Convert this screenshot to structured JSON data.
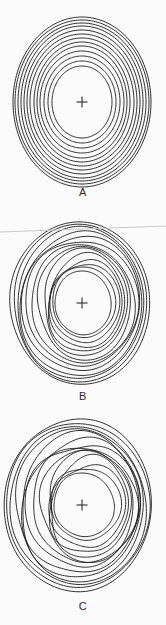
{
  "figure": {
    "width": 166,
    "height": 625,
    "background_color": "#fbfbfb",
    "line_color": "#1a1a1a",
    "marker_color": "#2b2b2b",
    "artifact_color": "#c9c9c9"
  },
  "panels": [
    {
      "id": "A",
      "label": "A",
      "label_y": 186,
      "center": {
        "x": 82,
        "y": 102
      },
      "marker": "plus-cross",
      "marker_size": 11,
      "ring_count": 13,
      "regularity": "regular",
      "bbox": {
        "x": 13,
        "y": 12,
        "width": 139,
        "height": 170
      },
      "rings": [
        {
          "rx": 30,
          "ry": 36,
          "wobble": 0.0,
          "phase": 0.0,
          "offset_x": 0,
          "offset_y": 0
        },
        {
          "rx": 34,
          "ry": 41,
          "wobble": 0.0,
          "phase": 0.4,
          "offset_x": 0,
          "offset_y": 0
        },
        {
          "rx": 38,
          "ry": 46,
          "wobble": 0.0,
          "phase": 0.8,
          "offset_x": 0,
          "offset_y": 0
        },
        {
          "rx": 42,
          "ry": 51,
          "wobble": 0.0,
          "phase": 1.2,
          "offset_x": 0,
          "offset_y": 0
        },
        {
          "rx": 45,
          "ry": 56,
          "wobble": 0.0,
          "phase": 1.6,
          "offset_x": 0,
          "offset_y": 0
        },
        {
          "rx": 48,
          "ry": 60,
          "wobble": 0.0,
          "phase": 2.0,
          "offset_x": 0,
          "offset_y": 0
        },
        {
          "rx": 52,
          "ry": 64,
          "wobble": 0.0,
          "phase": 2.4,
          "offset_x": 0,
          "offset_y": 0
        },
        {
          "rx": 55,
          "ry": 68,
          "wobble": 0.0,
          "phase": 2.8,
          "offset_x": 0,
          "offset_y": 0
        },
        {
          "rx": 58,
          "ry": 72,
          "wobble": 0.0,
          "phase": 3.2,
          "offset_x": 0,
          "offset_y": 0
        },
        {
          "rx": 61,
          "ry": 76,
          "wobble": 0.0,
          "phase": 3.6,
          "offset_x": 0,
          "offset_y": 0
        },
        {
          "rx": 64,
          "ry": 79,
          "wobble": 0.0,
          "phase": 4.0,
          "offset_x": 0,
          "offset_y": 0
        },
        {
          "rx": 67,
          "ry": 82,
          "wobble": 0.0,
          "phase": 4.4,
          "offset_x": 0,
          "offset_y": 0
        },
        {
          "rx": 69,
          "ry": 85,
          "wobble": 0.0,
          "phase": 4.8,
          "offset_x": 0,
          "offset_y": 0
        }
      ]
    },
    {
      "id": "B",
      "label": "B",
      "label_y": 390,
      "center": {
        "x": 82,
        "y": 303
      },
      "marker": "plus-cross",
      "marker_size": 11,
      "ring_count": 14,
      "regularity": "moderately-irregular",
      "bbox": {
        "x": 12,
        "y": 222,
        "width": 140,
        "height": 163
      },
      "rings": [
        {
          "rx": 28,
          "ry": 32,
          "wobble": 0.5,
          "phase": 0.2,
          "offset_x": 1,
          "offset_y": 0
        },
        {
          "rx": 31,
          "ry": 36,
          "wobble": 0.9,
          "phase": 1.1,
          "offset_x": 2,
          "offset_y": -1
        },
        {
          "rx": 34,
          "ry": 40,
          "wobble": 1.4,
          "phase": 2.0,
          "offset_x": 3,
          "offset_y": 0
        },
        {
          "rx": 36,
          "ry": 44,
          "wobble": 1.8,
          "phase": 2.9,
          "offset_x": 4,
          "offset_y": 1
        },
        {
          "rx": 39,
          "ry": 48,
          "wobble": 2.2,
          "phase": 3.8,
          "offset_x": 4,
          "offset_y": 0
        },
        {
          "rx": 43,
          "ry": 52,
          "wobble": 2.0,
          "phase": 4.7,
          "offset_x": 3,
          "offset_y": -1
        },
        {
          "rx": 47,
          "ry": 56,
          "wobble": 1.6,
          "phase": 5.6,
          "offset_x": 2,
          "offset_y": 0
        },
        {
          "rx": 51,
          "ry": 60,
          "wobble": 1.9,
          "phase": 0.6,
          "offset_x": 1,
          "offset_y": 1
        },
        {
          "rx": 55,
          "ry": 64,
          "wobble": 2.3,
          "phase": 1.5,
          "offset_x": 0,
          "offset_y": 0
        },
        {
          "rx": 58,
          "ry": 68,
          "wobble": 2.0,
          "phase": 2.4,
          "offset_x": -1,
          "offset_y": 0
        },
        {
          "rx": 61,
          "ry": 72,
          "wobble": 1.7,
          "phase": 3.3,
          "offset_x": -1,
          "offset_y": 1
        },
        {
          "rx": 64,
          "ry": 75,
          "wobble": 1.4,
          "phase": 4.2,
          "offset_x": -2,
          "offset_y": 0
        },
        {
          "rx": 67,
          "ry": 78,
          "wobble": 1.1,
          "phase": 5.1,
          "offset_x": -2,
          "offset_y": 0
        },
        {
          "rx": 70,
          "ry": 81,
          "wobble": 0.8,
          "phase": 6.0,
          "offset_x": -2,
          "offset_y": 0
        }
      ]
    },
    {
      "id": "C",
      "label": "C",
      "label_y": 600,
      "center": {
        "x": 82,
        "y": 505
      },
      "marker": "plus-cross",
      "marker_size": 11,
      "ring_count": 14,
      "regularity": "strongly-irregular",
      "bbox": {
        "x": 8,
        "y": 415,
        "width": 147,
        "height": 180
      },
      "rings": [
        {
          "rx": 30,
          "ry": 32,
          "wobble": 1.0,
          "phase": 0.3,
          "offset_x": 2,
          "offset_y": 0
        },
        {
          "rx": 34,
          "ry": 37,
          "wobble": 1.8,
          "phase": 1.4,
          "offset_x": 4,
          "offset_y": -1
        },
        {
          "rx": 37,
          "ry": 42,
          "wobble": 2.6,
          "phase": 2.5,
          "offset_x": 6,
          "offset_y": 1
        },
        {
          "rx": 40,
          "ry": 47,
          "wobble": 3.4,
          "phase": 3.6,
          "offset_x": 7,
          "offset_y": 0
        },
        {
          "rx": 43,
          "ry": 51,
          "wobble": 3.0,
          "phase": 4.7,
          "offset_x": 7,
          "offset_y": -1
        },
        {
          "rx": 47,
          "ry": 55,
          "wobble": 2.4,
          "phase": 5.8,
          "offset_x": 5,
          "offset_y": 1
        },
        {
          "rx": 51,
          "ry": 59,
          "wobble": 3.2,
          "phase": 0.9,
          "offset_x": 3,
          "offset_y": 0
        },
        {
          "rx": 55,
          "ry": 63,
          "wobble": 3.8,
          "phase": 2.0,
          "offset_x": 1,
          "offset_y": 0
        },
        {
          "rx": 58,
          "ry": 67,
          "wobble": 3.4,
          "phase": 3.1,
          "offset_x": -1,
          "offset_y": 1
        },
        {
          "rx": 61,
          "ry": 71,
          "wobble": 2.8,
          "phase": 4.2,
          "offset_x": -2,
          "offset_y": 0
        },
        {
          "rx": 65,
          "ry": 75,
          "wobble": 2.2,
          "phase": 5.3,
          "offset_x": -3,
          "offset_y": 0
        },
        {
          "rx": 68,
          "ry": 79,
          "wobble": 1.8,
          "phase": 0.1,
          "offset_x": -4,
          "offset_y": 1
        },
        {
          "rx": 71,
          "ry": 83,
          "wobble": 1.4,
          "phase": 1.2,
          "offset_x": -4,
          "offset_y": 0
        },
        {
          "rx": 73,
          "ry": 87,
          "wobble": 1.0,
          "phase": 2.3,
          "offset_x": -4,
          "offset_y": 0
        }
      ]
    }
  ],
  "artifact": {
    "name": "scan-line",
    "x1": 0,
    "y1": 232,
    "x2": 166,
    "y2": 226
  }
}
